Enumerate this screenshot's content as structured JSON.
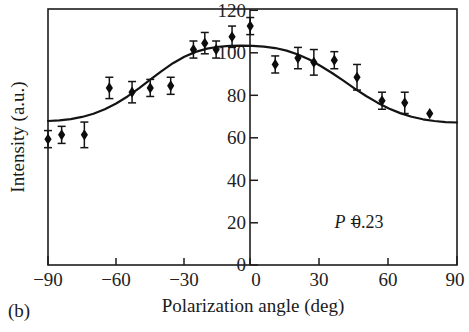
{
  "figure": {
    "panel_label": "(b)",
    "annotation": {
      "symbol": "P",
      "equals": " = ",
      "value": "0.23",
      "full": "P = 0.23"
    }
  },
  "chart_data": {
    "type": "scatter",
    "title": "",
    "subtitle": "",
    "xlabel": "Polarization angle (deg)",
    "ylabel": "Intensity (a.u.)",
    "xlim": [
      -90,
      90
    ],
    "ylim": [
      0,
      120
    ],
    "xticks": [
      -90,
      -60,
      -30,
      0,
      30,
      60,
      90
    ],
    "xtick_labels": [
      "−90",
      "−60",
      "−30",
      "0",
      "30",
      "60",
      "90"
    ],
    "yticks": [
      0,
      20,
      40,
      60,
      80,
      100,
      120
    ],
    "ytick_labels": [
      "0",
      "20",
      "40",
      "60",
      "80",
      "100",
      "120"
    ],
    "grid": false,
    "legend": "none",
    "y_axis_position": "center-at-x0",
    "annotations": [
      {
        "text": "P = 0.23",
        "x": 40,
        "y": 22,
        "italic_symbol": "P"
      }
    ],
    "series": [
      {
        "name": "Measured intensity",
        "type": "scatter-with-errorbars",
        "marker": "filled-diamond",
        "color": "#0d0d0d",
        "x": [
          -90,
          -84,
          -74,
          -63,
          -53,
          -45,
          -36,
          -26,
          -21,
          -16,
          -9,
          -1,
          10,
          20,
          27,
          36,
          46,
          57,
          67,
          78
        ],
        "y": [
          59,
          61,
          61,
          83,
          81,
          83,
          84,
          101,
          104,
          101,
          107,
          112,
          94,
          97,
          95,
          96,
          88,
          77,
          76,
          71
        ],
        "yerr": [
          4,
          4,
          6,
          5,
          5,
          4,
          4,
          4,
          5,
          4,
          5,
          4,
          4,
          5,
          6,
          4,
          6,
          4,
          5,
          0
        ]
      },
      {
        "name": "Fit curve",
        "type": "line",
        "color": "#141414",
        "description": "Smooth cosine-squared style fit peaking near 0 deg",
        "x": [
          -90,
          -85,
          -80,
          -75,
          -70,
          -65,
          -60,
          -55,
          -50,
          -45,
          -40,
          -35,
          -30,
          -25,
          -20,
          -15,
          -10,
          -5,
          0,
          5,
          10,
          15,
          20,
          25,
          30,
          35,
          40,
          45,
          50,
          55,
          60,
          65,
          70,
          75,
          80,
          85,
          90
        ],
        "y": [
          67.5,
          67.8,
          68.4,
          69.4,
          70.9,
          73.0,
          75.7,
          79.0,
          82.8,
          86.9,
          90.9,
          94.6,
          97.6,
          99.9,
          101.4,
          102.3,
          102.7,
          102.8,
          102.7,
          102.4,
          101.7,
          100.5,
          98.7,
          96.3,
          93.3,
          90.0,
          86.4,
          82.7,
          79.2,
          76.1,
          73.4,
          71.2,
          69.5,
          68.3,
          67.5,
          67.0,
          66.8
        ]
      }
    ]
  }
}
